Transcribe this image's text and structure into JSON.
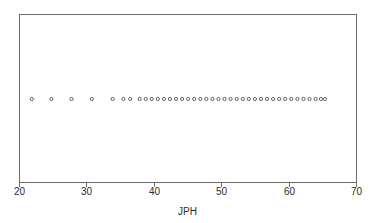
{
  "chart_data": {
    "type": "scatter",
    "plot_style": "dot-plot",
    "title": "",
    "subtitle": "",
    "xlabel": "JPH",
    "ylabel": "",
    "xlim": [
      20,
      70
    ],
    "ylim": [
      0,
      1
    ],
    "x_ticks": [
      20,
      30,
      40,
      50,
      60,
      70
    ],
    "x_tick_labels": [
      "20",
      "30",
      "40",
      "50",
      "60",
      "70"
    ],
    "y_ticks": [],
    "y_tick_labels": [],
    "grid": false,
    "legend": null,
    "legend_position": "none",
    "annotations": [],
    "marker": {
      "shape": "circle-open",
      "size_px": 3.2,
      "stroke_color": "#555555",
      "fill_color": "none"
    },
    "frame_color": "#6d6d6d",
    "background_color": "#ffffff",
    "series": [
      {
        "name": "JPH",
        "y_constant": 0.5,
        "x": [
          21.9,
          24.8,
          27.8,
          30.8,
          33.9,
          35.5,
          36.5,
          37.9,
          38.8,
          39.7,
          40.6,
          41.5,
          42.4,
          43.3,
          44.2,
          45.1,
          46.0,
          46.9,
          47.8,
          48.7,
          49.6,
          50.5,
          51.4,
          52.3,
          53.2,
          54.1,
          55.0,
          55.9,
          56.8,
          57.7,
          58.6,
          59.5,
          60.4,
          61.3,
          62.2,
          63.1,
          64.0,
          64.8,
          65.4
        ]
      }
    ],
    "n_points": 39,
    "x_min_observed": 21.9,
    "x_max_observed": 65.4
  },
  "figure": {
    "plot_area": {
      "left_px": 19,
      "top_px": 14,
      "right_px": 356,
      "bottom_px": 182
    },
    "dot_row_y_px": 99,
    "tick_length_px": 5,
    "tick_label_y_px": 195,
    "axis_title_y_px": 215
  }
}
